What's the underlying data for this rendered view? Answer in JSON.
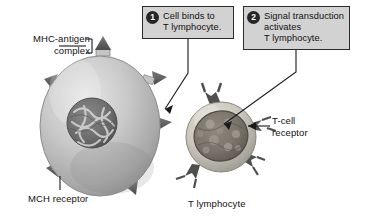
{
  "figure": {
    "background_color": "#ffffff"
  },
  "callouts": [
    {
      "number": "1",
      "text": "Cell binds to\nT lymphocyte.",
      "fill_color": "#d2d2d2",
      "border_color": "#2b2b2b",
      "badge_color": "#262626"
    },
    {
      "number": "2",
      "text": "Signal transduction\nactivates\nT lymphocyte.",
      "fill_color": "#d2d2d2",
      "border_color": "#2b2b2b",
      "badge_color": "#262626"
    }
  ],
  "labels": {
    "mhc_antigen_complex": "MHC-antigen\ncomplex",
    "mch_receptor": "MCH receptor",
    "tcell_receptor": "T-cell\nreceptor",
    "t_lymphocyte": "T lymphocyte"
  },
  "structures": {
    "presenting_cell": {
      "name": "antigen-presenting cell",
      "shape": "oval",
      "body_color": "#b9b9b9",
      "nucleus_color": "#6e6e6e"
    },
    "t_lymphocyte_cell": {
      "name": "T lymphocyte",
      "shape": "round",
      "cytoplasm_color": "#c9c6bd",
      "nucleus_color": "#7a756e"
    },
    "receptor_spike": {
      "name": "triangular receptor spike",
      "color": "#5d5d5d"
    },
    "tcell_receptor_fork": {
      "name": "Y-shaped T-cell receptor",
      "color": "#4a4a4a"
    }
  },
  "leader_lines": {
    "color": "#1a1a1a"
  }
}
